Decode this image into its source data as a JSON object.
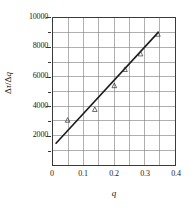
{
  "chart_data": {
    "type": "scatter",
    "title": "",
    "xlabel": "q",
    "ylabel": "Δτ/Δq",
    "xlim": [
      0,
      0.4
    ],
    "ylim": [
      0,
      10000
    ],
    "grid": true,
    "legend": "none",
    "x_major_ticks": [
      "0",
      "0.1",
      "0.2",
      "0.3",
      "0.4"
    ],
    "x_major_values": [
      0,
      0.1,
      0.2,
      0.3,
      0.4
    ],
    "x_gridline_step": 0.05,
    "y_major_ticks": [
      "2000",
      "4000",
      "6000",
      "8000",
      "10000"
    ],
    "y_major_values": [
      2000,
      4000,
      6000,
      8000,
      10000
    ],
    "y_gridline_step": 1000,
    "marker": "triangle-up",
    "series": [
      {
        "name": "measured",
        "type": "scatter",
        "x": [
          0.048,
          0.137,
          0.201,
          0.236,
          0.287,
          0.344
        ],
        "y": [
          3050,
          3780,
          5400,
          6500,
          7560,
          8900
        ]
      },
      {
        "name": "fit-line",
        "type": "line",
        "x": [
          0.01,
          0.345
        ],
        "y": [
          1480,
          9020
        ]
      }
    ]
  },
  "axes": {
    "y_ticks": [
      {
        "label": "10000",
        "value": 10000
      },
      {
        "label": "8000",
        "value": 8000
      },
      {
        "label": "6000",
        "value": 6000
      },
      {
        "label": "4000",
        "value": 4000
      },
      {
        "label": "2000",
        "value": 2000
      }
    ],
    "y_minor_values": [
      9000,
      7000,
      5000,
      3000,
      1000
    ],
    "x_ticks": [
      {
        "label": "0",
        "value": 0
      },
      {
        "label": "0.1",
        "value": 0.1
      },
      {
        "label": "0.2",
        "value": 0.2
      },
      {
        "label": "0.3",
        "value": 0.3
      },
      {
        "label": "0.4",
        "value": 0.4
      }
    ],
    "y_title_delta": "Δ",
    "y_title_tau": "τ",
    "y_title_slash": "/",
    "y_title_delta2": "Δ",
    "y_title_q": "q",
    "x_title": "q"
  },
  "colors": {
    "frame": "#3a3a3a",
    "grid": "#6b6b6b",
    "line": "#1a1a1a",
    "marker": "#2b2b2b",
    "background": "#ffffff"
  }
}
